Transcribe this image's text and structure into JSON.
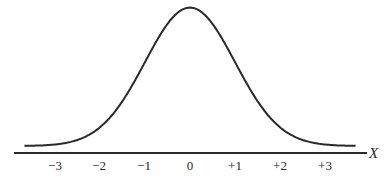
{
  "chart_data": {
    "type": "line",
    "title": "",
    "xlabel": "X",
    "ylabel": "",
    "xlim": [
      -3.7,
      3.7
    ],
    "ylim": [
      0,
      0.4
    ],
    "grid": false,
    "legend": null,
    "tick_labels": [
      "−3",
      "−2",
      "−1",
      "0",
      "+1",
      "+2",
      "+3"
    ],
    "tick_values": [
      -3,
      -2,
      -1,
      0,
      1,
      2,
      3
    ],
    "series": [
      {
        "name": "normal curve",
        "x": [
          -3.6,
          -3,
          -2.5,
          -2,
          -1.5,
          -1,
          -0.5,
          0,
          0.5,
          1,
          1.5,
          2,
          2.5,
          3,
          3.6
        ],
        "values": [
          0.0006,
          0.0044,
          0.0175,
          0.054,
          0.1295,
          0.242,
          0.3521,
          0.3989,
          0.3521,
          0.242,
          0.1295,
          0.054,
          0.0175,
          0.0044,
          0.0006
        ]
      }
    ],
    "colors": {
      "curve": "#2a2a2a",
      "axis": "#2a2a2a"
    }
  }
}
